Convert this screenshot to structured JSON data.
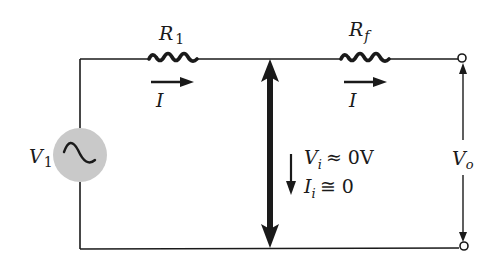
{
  "figure": {
    "type": "circuit-schematic",
    "colors": {
      "wire": "#1a1a1a",
      "source_fill": "#c9c9c9",
      "background": "#ffffff"
    }
  },
  "components": {
    "source": {
      "label": "V",
      "subscript": "1",
      "symbol": "~"
    },
    "r1": {
      "label": "R",
      "subscript": "1"
    },
    "rf": {
      "label": "R",
      "subscript": "f"
    },
    "current_r1": {
      "label": "I"
    },
    "current_rf": {
      "label": "I"
    },
    "virtual_ground": {
      "vi_label": "V",
      "vi_subscript": "i",
      "vi_relation": "≈ 0V",
      "ii_label": "I",
      "ii_subscript": "i",
      "ii_relation": "≅ 0"
    },
    "output": {
      "label": "V",
      "subscript": "o"
    }
  }
}
